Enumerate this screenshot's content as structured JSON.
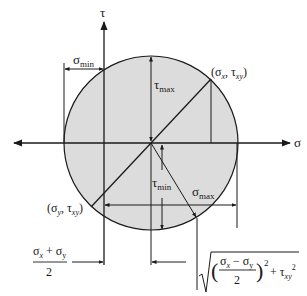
{
  "diagram": {
    "axes": {
      "horizontal_label": "σ",
      "vertical_label": "τ"
    },
    "colors": {
      "circle_fill": "#dcdcdc",
      "line": "#1a1a1a",
      "background": "#ffffff"
    },
    "labels": {
      "sigma_min": {
        "main": "σ",
        "sub": "min"
      },
      "sigma_max": {
        "main": "σ",
        "sub": "max"
      },
      "tau_max": {
        "main": "τ",
        "sub": "max"
      },
      "tau_min": {
        "main": "τ",
        "sub": "min"
      },
      "point_x": {
        "open": "(σ",
        "sub1": "x",
        "mid": ", τ",
        "sub2": "xy",
        "close": ")"
      },
      "point_y": {
        "open": "(σ",
        "sub1": "y",
        "mid": ", τ",
        "sub2": "xy",
        "close": ")"
      },
      "center_formula": {
        "numerator": "σx + σy",
        "num_a": "σ",
        "num_a_sub": "x",
        "num_plus": " + σ",
        "num_b_sub": "y",
        "denominator": "2"
      },
      "radius_formula": {
        "sqrt_symbol": "√",
        "frac_num_a": "σ",
        "frac_num_a_sub": "x",
        "frac_minus": " − σ",
        "frac_num_b_sub": "y",
        "frac_den": "2",
        "exp": "2",
        "plus": "+ τ",
        "tau_sub": "xy",
        "tau_exp": "2"
      }
    }
  }
}
